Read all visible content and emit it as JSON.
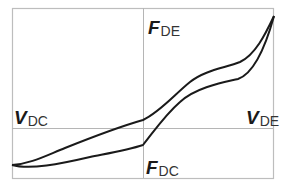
{
  "diagram": {
    "labels": {
      "f_de": {
        "main": "F",
        "sub": "DE"
      },
      "f_dc": {
        "main": "F",
        "sub": "DC"
      },
      "v_dc": {
        "main": "V",
        "sub": "DC"
      },
      "v_de": {
        "main": "V",
        "sub": "DE"
      }
    },
    "colors": {
      "frame": "#bdbdbd",
      "gridline": "#b5b5b5",
      "curve": "#1a1a1a",
      "background": "#ffffff"
    }
  }
}
